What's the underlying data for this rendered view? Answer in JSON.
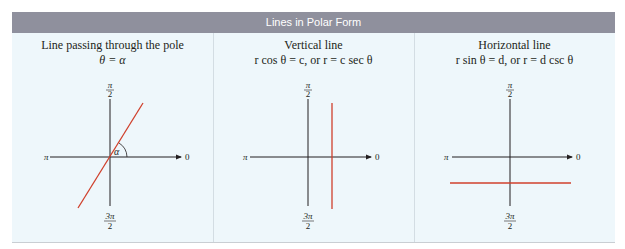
{
  "table": {
    "title": "Lines in Polar Form",
    "colors": {
      "header_bg": "#8f909d",
      "header_text": "#ffffff",
      "body_bg": "#eef7fb",
      "axis": "#231f20",
      "line": "#d0402c"
    },
    "columns": [
      {
        "title": "Line passing through the pole",
        "equation": "θ = α",
        "line_type": "through-pole",
        "angle_label": "α"
      },
      {
        "title": "Vertical line",
        "equation": "r cos θ = c, or r = c sec θ",
        "line_type": "vertical"
      },
      {
        "title": "Horizontal line",
        "equation": "r sin θ = d, or r = d csc θ",
        "line_type": "horizontal"
      }
    ],
    "axis_labels": {
      "top_num": "π",
      "top_den": "2",
      "bottom_num": "3π",
      "bottom_den": "2",
      "left": "π",
      "right": "0"
    }
  }
}
